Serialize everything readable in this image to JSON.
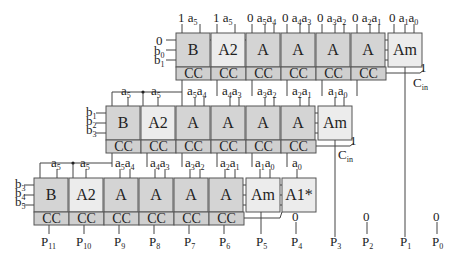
{
  "rows": [
    {
      "blocks": [
        "B",
        "A2",
        "A",
        "A",
        "A",
        "A",
        "Am"
      ],
      "cc": [
        "CC",
        "CC",
        "CC",
        "CC",
        "CC",
        "CC"
      ],
      "inputs_top": [
        "1 a5",
        "1 a5",
        "0 a5a4",
        "0 a4a3",
        "0 a3a2",
        "0 a2a1",
        "0 a1a0"
      ],
      "inputs_left": [
        "0",
        "b0",
        "b1"
      ],
      "carry_in": {
        "value": "1",
        "label": "Cin"
      }
    },
    {
      "blocks": [
        "B",
        "A2",
        "A",
        "A",
        "A",
        "A",
        "Am"
      ],
      "cc": [
        "CC",
        "CC",
        "CC",
        "CC",
        "CC",
        "CC"
      ],
      "inputs_top": [
        "a5",
        "a5",
        "a5a4",
        "a4a3",
        "a3a2",
        "a2a1",
        "a1a0"
      ],
      "inputs_left": [
        "b1",
        "b2",
        "b3"
      ],
      "carry_in": {
        "value": "1",
        "label": "Cin"
      }
    },
    {
      "blocks": [
        "B",
        "A2",
        "A",
        "A",
        "A",
        "A",
        "Am",
        "A1*"
      ],
      "cc": [
        "CC",
        "CC",
        "CC",
        "CC",
        "CC",
        "CC"
      ],
      "inputs_top": [
        "a5",
        "a5",
        "a5a4",
        "a4a3",
        "a3a2",
        "a2a1",
        "a1a0",
        "a0"
      ],
      "inputs_left": [
        "b3",
        "b4",
        "b5"
      ],
      "extra_zero": "0"
    }
  ],
  "outputs": [
    "P11",
    "P10",
    "P9",
    "P8",
    "P7",
    "P6",
    "P5",
    "P4",
    "P3",
    "P2",
    "P1",
    "P0"
  ],
  "constant_zero_outputs": {
    "P2": "0",
    "P0": "0",
    "P4": "0"
  }
}
